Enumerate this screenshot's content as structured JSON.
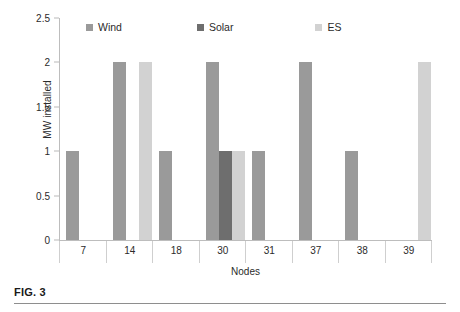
{
  "chart_data": {
    "type": "bar",
    "title": "",
    "xlabel": "Nodes",
    "ylabel": "MW installed",
    "categories": [
      "7",
      "14",
      "18",
      "30",
      "31",
      "37",
      "38",
      "39"
    ],
    "series": [
      {
        "name": "Wind",
        "color": "#9a9a9a",
        "values": [
          1,
          2,
          1,
          2,
          1,
          2,
          1,
          0
        ]
      },
      {
        "name": "Solar",
        "color": "#6e6e6e",
        "values": [
          0,
          0,
          0,
          1,
          0,
          0,
          0,
          0
        ]
      },
      {
        "name": "ES",
        "color": "#d2d2d2",
        "values": [
          0,
          2,
          0,
          1,
          0,
          0,
          0,
          2
        ]
      }
    ],
    "ylim": [
      0,
      2.5
    ],
    "yticks": [
      "0",
      "0.5",
      "1",
      "1.5",
      "2",
      "2.5"
    ],
    "ytick_values": [
      0,
      0.5,
      1,
      1.5,
      2,
      2.5
    ],
    "grid": false,
    "legend_position": "top-inside"
  },
  "figure": {
    "caption": "FIG. 3"
  }
}
